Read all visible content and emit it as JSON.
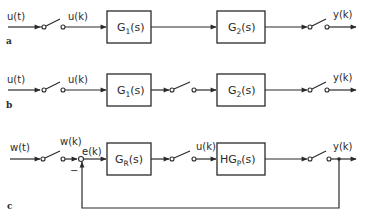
{
  "diagram": {
    "type": "block-diagram",
    "panels": [
      {
        "id": "a",
        "label": "a",
        "input_signal": "u(t)",
        "sampled_signal": "u(k)",
        "blocks": [
          {
            "name": "G",
            "sub": "1",
            "arg": "(s)"
          },
          {
            "name": "G",
            "sub": "2",
            "arg": "(s)"
          }
        ],
        "output_signal": "y(k)"
      },
      {
        "id": "b",
        "label": "b",
        "input_signal": "u(t)",
        "sampled_signal": "u(k)",
        "blocks": [
          {
            "name": "G",
            "sub": "1",
            "arg": "(s)"
          },
          {
            "name": "G",
            "sub": "2",
            "arg": "(s)"
          }
        ],
        "output_signal": "y(k)"
      },
      {
        "id": "c",
        "label": "c",
        "input_signal": "w(t)",
        "sampled_signal": "w(k)",
        "error_signal": "e(k)",
        "feedback_sign": "−",
        "blocks": [
          {
            "name": "G",
            "sub": "R",
            "arg": "(s)"
          },
          {
            "name": "HG",
            "sub": "P",
            "arg": "(s)"
          }
        ],
        "control_signal": "u(k)",
        "output_signal": "y(k)"
      }
    ]
  }
}
